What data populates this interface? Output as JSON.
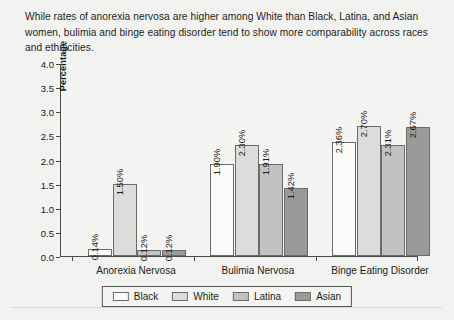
{
  "caption": "While rates of anorexia nervosa are higher among White than Black, Latina, and Asian women, bulimia and binge eating disorder tend to show more comparability across races and ethnicities.",
  "chart_data": {
    "type": "bar",
    "title": "",
    "xlabel": "",
    "ylabel": "Percentage",
    "ylim": [
      0,
      4.0
    ],
    "ytick_labels": [
      "0.0",
      "0.5",
      "1.0",
      "1.5",
      "2.0",
      "2.5",
      "3.0",
      "3.5",
      "4.0"
    ],
    "ytick_values": [
      0,
      0.5,
      1.0,
      1.5,
      2.0,
      2.5,
      3.0,
      3.5,
      4.0
    ],
    "grid": false,
    "legend_position": "bottom",
    "categories": [
      "Anorexia Nervosa",
      "Bulimia Nervosa",
      "Binge Eating Disorder"
    ],
    "series": [
      {
        "name": "Black",
        "color": "#fbfbfa",
        "values": [
          0.14,
          1.9,
          2.36
        ],
        "labels": [
          "0.14%",
          "1.90%",
          "2.36%"
        ]
      },
      {
        "name": "White",
        "color": "#dcdcda",
        "values": [
          1.5,
          2.3,
          2.7
        ],
        "labels": [
          "1.50%",
          "2.30%",
          "2.70%"
        ]
      },
      {
        "name": "Latina",
        "color": "#c2c2c0",
        "values": [
          0.12,
          1.91,
          2.31
        ],
        "labels": [
          "0.12%",
          "1.91%",
          "2.31%"
        ]
      },
      {
        "name": "Asian",
        "color": "#9a9a98",
        "values": [
          0.12,
          1.42,
          2.67
        ],
        "labels": [
          "0.12%",
          "1.42%",
          "2.67%"
        ]
      }
    ]
  }
}
